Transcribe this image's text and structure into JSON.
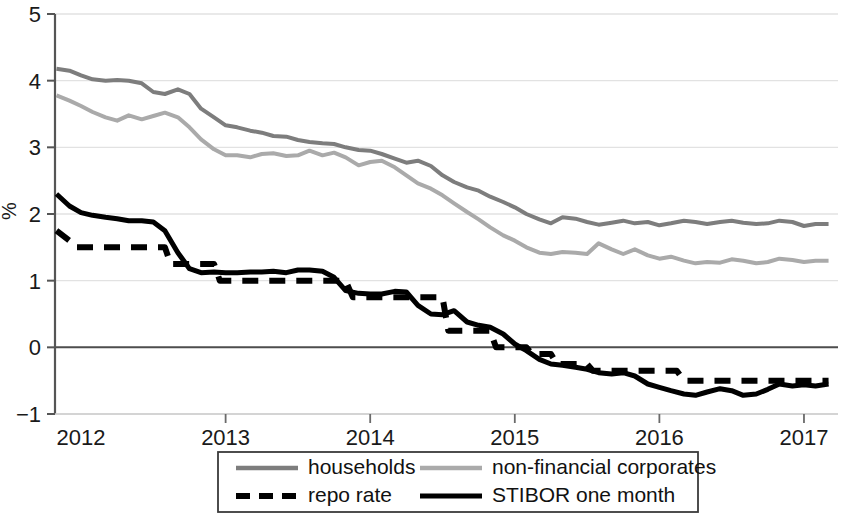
{
  "chart_data": {
    "type": "line",
    "title": "",
    "xlabel": "",
    "ylabel": "%",
    "ylim": [
      -1,
      5
    ],
    "xlim": [
      2011.82,
      2017.18
    ],
    "grid": true,
    "legend_position": "bottom",
    "y_ticks": [
      "5",
      "4",
      "3",
      "2",
      "1",
      "0",
      "-1"
    ],
    "y_tick_values": [
      5,
      4,
      3,
      2,
      1,
      0,
      -1
    ],
    "x_ticks": [
      "2012",
      "2013",
      "2014",
      "2015",
      "2016",
      "2017"
    ],
    "x_tick_values": [
      2012,
      2013,
      2014,
      2015,
      2016,
      2017
    ],
    "series": [
      {
        "name": "households",
        "color": "#7d7d7d",
        "style": "solid",
        "width": 4,
        "x": [
          2011.83,
          2011.92,
          2012.0,
          2012.08,
          2012.17,
          2012.25,
          2012.33,
          2012.42,
          2012.5,
          2012.58,
          2012.67,
          2012.75,
          2012.83,
          2012.92,
          2013.0,
          2013.08,
          2013.17,
          2013.25,
          2013.33,
          2013.42,
          2013.5,
          2013.58,
          2013.67,
          2013.75,
          2013.83,
          2013.92,
          2014.0,
          2014.08,
          2014.17,
          2014.25,
          2014.33,
          2014.42,
          2014.5,
          2014.58,
          2014.67,
          2014.75,
          2014.83,
          2014.92,
          2015.0,
          2015.08,
          2015.17,
          2015.25,
          2015.33,
          2015.42,
          2015.5,
          2015.58,
          2015.67,
          2015.75,
          2015.83,
          2015.92,
          2016.0,
          2016.08,
          2016.17,
          2016.25,
          2016.33,
          2016.42,
          2016.5,
          2016.58,
          2016.67,
          2016.75,
          2016.83,
          2016.92,
          2017.0,
          2017.08,
          2017.17
        ],
        "values": [
          4.18,
          4.15,
          4.08,
          4.02,
          4.0,
          4.01,
          4.0,
          3.96,
          3.83,
          3.8,
          3.87,
          3.8,
          3.58,
          3.45,
          3.33,
          3.3,
          3.25,
          3.22,
          3.17,
          3.16,
          3.11,
          3.08,
          3.06,
          3.05,
          3.0,
          2.96,
          2.95,
          2.9,
          2.83,
          2.77,
          2.8,
          2.72,
          2.58,
          2.48,
          2.4,
          2.35,
          2.26,
          2.18,
          2.1,
          2.0,
          1.92,
          1.86,
          1.95,
          1.93,
          1.88,
          1.84,
          1.87,
          1.9,
          1.86,
          1.88,
          1.83,
          1.86,
          1.9,
          1.88,
          1.85,
          1.88,
          1.9,
          1.87,
          1.85,
          1.86,
          1.9,
          1.88,
          1.82,
          1.85,
          1.85
        ]
      },
      {
        "name": "non-financial corporates",
        "color": "#aaaaaa",
        "style": "solid",
        "width": 4,
        "x": [
          2011.83,
          2011.92,
          2012.0,
          2012.08,
          2012.17,
          2012.25,
          2012.33,
          2012.42,
          2012.5,
          2012.58,
          2012.67,
          2012.75,
          2012.83,
          2012.92,
          2013.0,
          2013.08,
          2013.17,
          2013.25,
          2013.33,
          2013.42,
          2013.5,
          2013.58,
          2013.67,
          2013.75,
          2013.83,
          2013.92,
          2014.0,
          2014.08,
          2014.17,
          2014.25,
          2014.33,
          2014.42,
          2014.5,
          2014.58,
          2014.67,
          2014.75,
          2014.83,
          2014.92,
          2015.0,
          2015.08,
          2015.17,
          2015.25,
          2015.33,
          2015.42,
          2015.5,
          2015.58,
          2015.67,
          2015.75,
          2015.83,
          2015.92,
          2016.0,
          2016.08,
          2016.17,
          2016.25,
          2016.33,
          2016.42,
          2016.5,
          2016.58,
          2016.67,
          2016.75,
          2016.83,
          2016.92,
          2017.0,
          2017.08,
          2017.17
        ],
        "values": [
          3.78,
          3.7,
          3.62,
          3.53,
          3.45,
          3.4,
          3.48,
          3.42,
          3.47,
          3.52,
          3.45,
          3.3,
          3.12,
          2.97,
          2.88,
          2.88,
          2.85,
          2.9,
          2.91,
          2.87,
          2.88,
          2.95,
          2.88,
          2.92,
          2.85,
          2.73,
          2.78,
          2.8,
          2.7,
          2.58,
          2.46,
          2.38,
          2.28,
          2.16,
          2.03,
          1.92,
          1.8,
          1.68,
          1.6,
          1.5,
          1.42,
          1.4,
          1.43,
          1.42,
          1.4,
          1.56,
          1.47,
          1.4,
          1.47,
          1.38,
          1.33,
          1.36,
          1.3,
          1.26,
          1.28,
          1.27,
          1.32,
          1.3,
          1.26,
          1.28,
          1.33,
          1.31,
          1.28,
          1.3,
          1.3
        ]
      },
      {
        "name": "repo rate",
        "color": "#000000",
        "style": "dashed",
        "width": 6,
        "x": [
          2011.83,
          2011.92,
          2011.96,
          2012.0,
          2012.58,
          2012.62,
          2012.92,
          2012.96,
          2013.83,
          2013.88,
          2014.5,
          2014.54,
          2014.83,
          2014.87,
          2015.08,
          2015.12,
          2015.25,
          2015.29,
          2015.5,
          2015.54,
          2016.12,
          2016.17,
          2017.17
        ],
        "values": [
          1.75,
          1.6,
          1.5,
          1.5,
          1.5,
          1.25,
          1.25,
          1.0,
          1.0,
          0.75,
          0.75,
          0.25,
          0.25,
          0.0,
          0.0,
          -0.1,
          -0.1,
          -0.25,
          -0.25,
          -0.35,
          -0.35,
          -0.5,
          -0.5
        ]
      },
      {
        "name": "STIBOR one month",
        "color": "#000000",
        "style": "solid",
        "width": 5,
        "x": [
          2011.83,
          2011.92,
          2012.0,
          2012.08,
          2012.17,
          2012.25,
          2012.33,
          2012.42,
          2012.5,
          2012.58,
          2012.67,
          2012.75,
          2012.83,
          2012.92,
          2013.0,
          2013.08,
          2013.17,
          2013.25,
          2013.33,
          2013.42,
          2013.5,
          2013.58,
          2013.67,
          2013.75,
          2013.83,
          2013.92,
          2014.0,
          2014.08,
          2014.17,
          2014.25,
          2014.33,
          2014.42,
          2014.5,
          2014.58,
          2014.67,
          2014.75,
          2014.83,
          2014.92,
          2015.0,
          2015.08,
          2015.17,
          2015.25,
          2015.33,
          2015.42,
          2015.5,
          2015.58,
          2015.67,
          2015.75,
          2015.83,
          2015.92,
          2016.0,
          2016.08,
          2016.17,
          2016.25,
          2016.33,
          2016.42,
          2016.5,
          2016.58,
          2016.67,
          2016.75,
          2016.83,
          2016.92,
          2017.0,
          2017.08,
          2017.17
        ],
        "values": [
          2.3,
          2.12,
          2.02,
          1.98,
          1.95,
          1.93,
          1.9,
          1.9,
          1.88,
          1.75,
          1.42,
          1.18,
          1.12,
          1.13,
          1.12,
          1.12,
          1.13,
          1.13,
          1.14,
          1.12,
          1.16,
          1.16,
          1.14,
          1.05,
          0.85,
          0.81,
          0.8,
          0.8,
          0.84,
          0.83,
          0.63,
          0.5,
          0.49,
          0.55,
          0.38,
          0.33,
          0.3,
          0.2,
          0.05,
          -0.05,
          -0.18,
          -0.25,
          -0.27,
          -0.3,
          -0.33,
          -0.38,
          -0.4,
          -0.38,
          -0.43,
          -0.55,
          -0.6,
          -0.65,
          -0.7,
          -0.72,
          -0.67,
          -0.62,
          -0.65,
          -0.72,
          -0.7,
          -0.63,
          -0.55,
          -0.58,
          -0.56,
          -0.58,
          -0.55
        ]
      }
    ],
    "legend": [
      {
        "label": "households",
        "color": "#7d7d7d",
        "style": "solid"
      },
      {
        "label": "non-financial corporates",
        "color": "#aaaaaa",
        "style": "solid"
      },
      {
        "label": "repo rate",
        "color": "#000000",
        "style": "dashed"
      },
      {
        "label": "STIBOR one month",
        "color": "#000000",
        "style": "solid"
      }
    ]
  },
  "axes": {
    "y_label": "%",
    "y_tick_labels": [
      "5",
      "4",
      "3",
      "2",
      "1",
      "0",
      "−1"
    ],
    "x_tick_labels": [
      "2012",
      "2013",
      "2014",
      "2015",
      "2016",
      "2017"
    ]
  },
  "legend_box": {
    "items": [
      {
        "label": "households"
      },
      {
        "label": "non-financial corporates"
      },
      {
        "label": "repo rate"
      },
      {
        "label": "STIBOR one month"
      }
    ]
  }
}
